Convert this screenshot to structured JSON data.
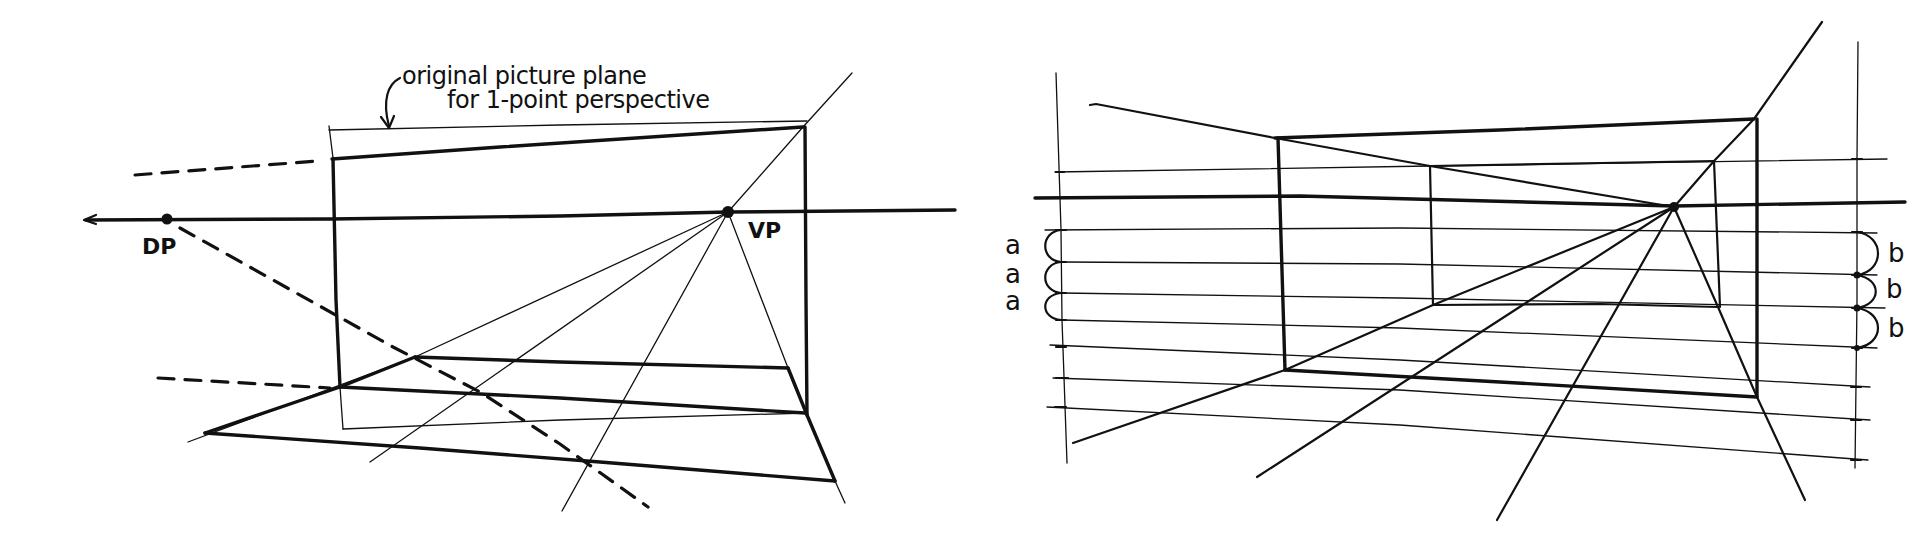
{
  "figures": [
    {
      "id": "left",
      "title": "Picture plane shift in one-point perspective",
      "annotation_line1": "original picture plane",
      "annotation_line2": "for 1-point perspective",
      "vanishing_point_label": "VP",
      "diagonal_point_label": "DP"
    },
    {
      "id": "right",
      "title": "Measuring lines with equal intervals",
      "left_interval_label": "a",
      "left_interval_labels": [
        "a",
        "a",
        "a"
      ],
      "right_interval_label": "b",
      "right_interval_labels": [
        "b",
        "b",
        "b"
      ]
    }
  ],
  "colors": {
    "ink": "#111111",
    "paper": "#ffffff"
  }
}
